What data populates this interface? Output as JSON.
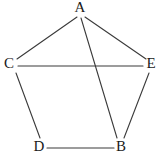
{
  "figure": {
    "kind": "undirected-graph-drawing",
    "width": 159,
    "height": 157,
    "background_color": "#ffffff",
    "edge_color": "#3a3a3a",
    "label_color": "#1a1a1a"
  },
  "chart_data": {
    "type": "diagram",
    "title": "",
    "xlabel": "",
    "ylabel": "",
    "grid": false,
    "legend": null,
    "nodes": [
      {
        "id": "A",
        "label": "A",
        "x": 80,
        "y": 10,
        "label_x": 80,
        "label_y": 9
      },
      {
        "id": "C",
        "label": "C",
        "x": 14,
        "y": 65,
        "label_x": 9,
        "label_y": 65
      },
      {
        "id": "E",
        "label": "E",
        "x": 147,
        "y": 65,
        "label_x": 151,
        "label_y": 65
      },
      {
        "id": "D",
        "label": "D",
        "x": 41,
        "y": 143,
        "label_x": 39,
        "label_y": 148
      },
      {
        "id": "B",
        "label": "B",
        "x": 120,
        "y": 143,
        "label_x": 121,
        "label_y": 148
      }
    ],
    "edges": [
      {
        "from": "A",
        "to": "C",
        "x1": 77,
        "y1": 17,
        "x2": 17,
        "y2": 59
      },
      {
        "from": "A",
        "to": "E",
        "x1": 85,
        "y1": 17,
        "x2": 146,
        "y2": 59
      },
      {
        "from": "A",
        "to": "B",
        "x1": 81,
        "y1": 18,
        "x2": 117,
        "y2": 138
      },
      {
        "from": "C",
        "to": "E",
        "x1": 18,
        "y1": 66,
        "x2": 143,
        "y2": 66
      },
      {
        "from": "C",
        "to": "D",
        "x1": 16,
        "y1": 73,
        "x2": 40,
        "y2": 138
      },
      {
        "from": "D",
        "to": "B",
        "x1": 47,
        "y1": 148,
        "x2": 114,
        "y2": 148
      },
      {
        "from": "B",
        "to": "E",
        "x1": 124,
        "y1": 138,
        "x2": 149,
        "y2": 73
      }
    ],
    "node_count": 5,
    "edge_count": 7
  }
}
